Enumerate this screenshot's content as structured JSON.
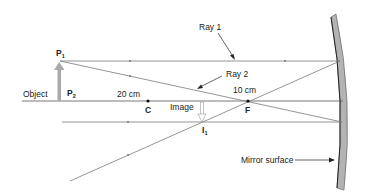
{
  "diagram": {
    "labels": {
      "object": "Object",
      "p1": "P",
      "p1_sub": "1",
      "p2": "P",
      "p2_sub": "2",
      "ray1": "Ray 1",
      "ray2": "Ray 2",
      "dist_c": "20 cm",
      "dist_f": "10 cm",
      "c_point": "C",
      "f_point": "F",
      "image": "Image",
      "i1": "I",
      "i1_sub": "1",
      "mirror": "Mirror surface"
    },
    "colors": {
      "ray_line": "#7a7a7a",
      "axis": "#555555",
      "mirror_fill": "#b3b3b3",
      "mirror_edge": "#333333",
      "object_arrow": "#aaaaaa"
    }
  }
}
